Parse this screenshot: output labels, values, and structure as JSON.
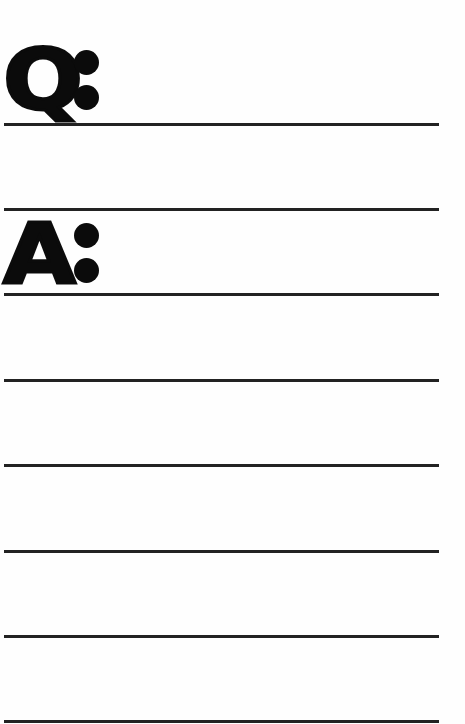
{
  "worksheet": {
    "question_label": "Q",
    "answer_label": "A",
    "separator": ":",
    "line_color": "#222222",
    "ink_color": "#0b0b0b",
    "question_lines": 2,
    "answer_lines": 6
  }
}
